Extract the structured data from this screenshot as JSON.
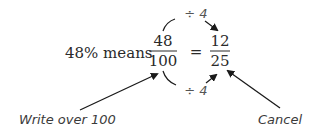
{
  "expression": {
    "prefix": "48% means",
    "left_fraction": {
      "numerator": "48",
      "denominator": "100"
    },
    "equals": "=",
    "right_fraction": {
      "numerator": "12",
      "denominator": "25"
    }
  },
  "operations": {
    "top": "÷ 4",
    "bottom": "÷ 4"
  },
  "annotations": {
    "left": "Write over 100",
    "right": "Cancel"
  },
  "colors": {
    "text": "#2a2a2a",
    "annotation": "#3a3a3a",
    "operation": "#555555",
    "arrow": "#1a1a1a"
  }
}
